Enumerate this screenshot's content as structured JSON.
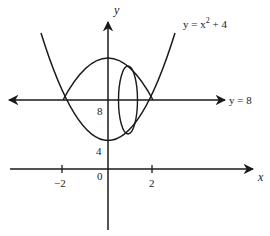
{
  "diagram": {
    "colors": {
      "stroke": "#1a1a1a",
      "background": "#ffffff"
    },
    "labels": {
      "y_axis": "y",
      "x_axis": "x",
      "curve_name": "y = x",
      "curve_exponent": "2",
      "curve_tail": " + 4",
      "line_label": "y = 8",
      "tick_8": "8",
      "tick_4": "4",
      "tick_neg2": "−2",
      "tick_0": "0",
      "tick_2": "2"
    },
    "elements": [
      {
        "name": "parabola",
        "equation": "y = x^2 + 4"
      },
      {
        "name": "reflected-arc",
        "equation": "y = 12 - x^2"
      },
      {
        "name": "axis-of-rotation",
        "equation": "y = 8"
      },
      {
        "name": "cross-section-ellipse",
        "position": "x ≈ 1"
      }
    ]
  }
}
